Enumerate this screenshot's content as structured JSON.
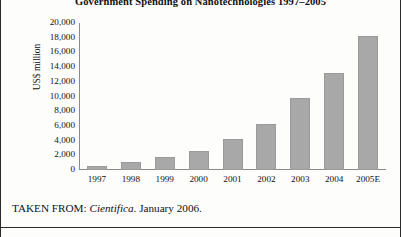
{
  "chart_data": {
    "type": "bar",
    "title": "Government Spending on Nanotechnologies 1997–2005",
    "xlabel": "",
    "ylabel": "US$ million",
    "categories": [
      "1997",
      "1998",
      "1999",
      "2000",
      "2001",
      "2002",
      "2003",
      "2004",
      "2005E"
    ],
    "values": [
      500,
      1100,
      1800,
      2600,
      4200,
      6200,
      9800,
      13200,
      18200
    ],
    "ylim": [
      0,
      20000
    ],
    "ytick_values": [
      20000,
      18000,
      16000,
      14000,
      12000,
      10000,
      8000,
      6000,
      4000,
      2000,
      0
    ],
    "ytick_labels": [
      "20,000",
      "18,000",
      "16,000",
      "14,000",
      "12,000",
      "10,000",
      "8,000",
      "6,000",
      "4,000",
      "2,000",
      "0"
    ],
    "grid": false,
    "legend": "none",
    "bar_color": "#a8a8a8",
    "axis_color": "#8a8a8a"
  },
  "caption": {
    "prefix": "TAKEN FROM: ",
    "source": "Cientifica",
    "suffix": ". January 2006."
  }
}
